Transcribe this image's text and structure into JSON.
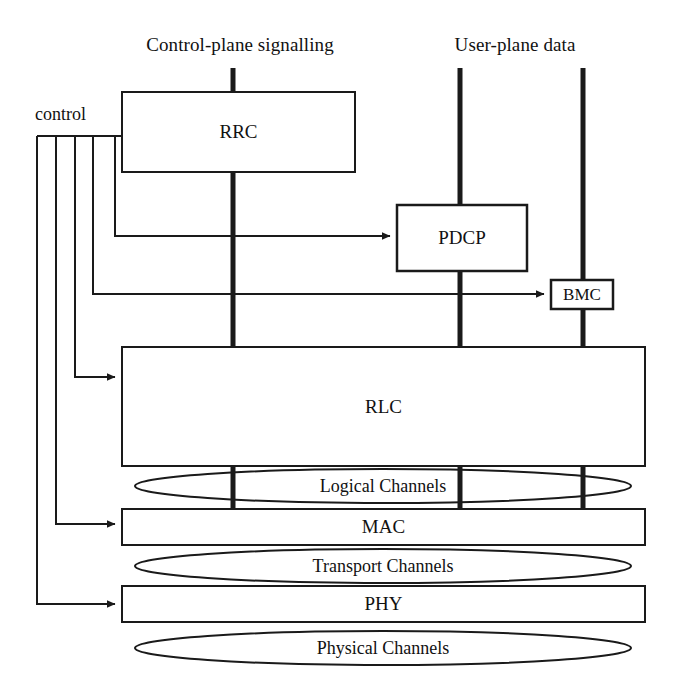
{
  "diagram": {
    "planes": {
      "control_plane_label": "Control-plane signalling",
      "user_plane_label": "User-plane data"
    },
    "control_bus": {
      "label": "control"
    },
    "layers": {
      "rrc": "RRC",
      "pdcp": "PDCP",
      "bmc": "BMC",
      "rlc": "RLC",
      "mac": "MAC",
      "phy": "PHY"
    },
    "channels": {
      "logical": "Logical Channels",
      "transport": "Transport Channels",
      "physical": "Physical Channels"
    },
    "colors": {
      "stroke": "#1a1a1a",
      "fill": "#ffffff",
      "background": "#ffffff"
    }
  }
}
